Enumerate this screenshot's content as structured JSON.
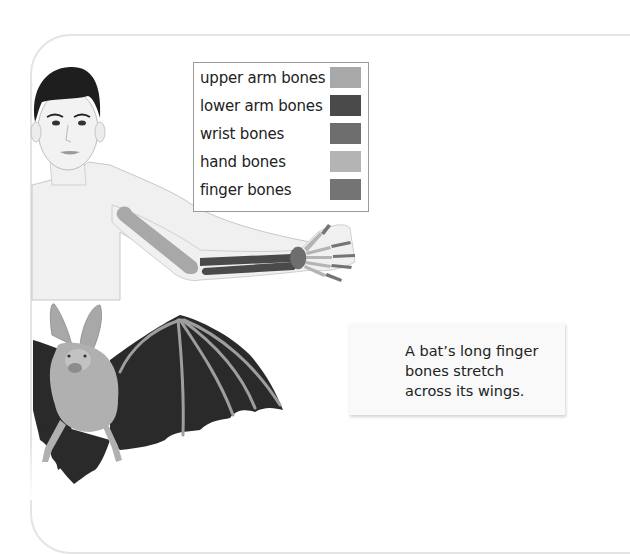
{
  "legend": {
    "items": [
      {
        "label": "upper arm bones",
        "color": "#a8a8a8"
      },
      {
        "label": "lower arm bones",
        "color": "#4a4a4a"
      },
      {
        "label": "wrist bones",
        "color": "#6e6e6e"
      },
      {
        "label": "hand bones",
        "color": "#b4b4b4"
      },
      {
        "label": "finger bones",
        "color": "#747474"
      }
    ]
  },
  "caption": {
    "text": "A bat’s long finger bones stretch across its wings."
  },
  "illustrations": {
    "human": "human-figure-with-arm-bones",
    "bat": "bat-with-wing-bones"
  },
  "colors": {
    "panel_border": "#e4e4e4",
    "skin": "#eeeeee",
    "hair": "#1e1e1e",
    "bat_wing": "#2a2a2a",
    "bat_fur": "#b0b0b0"
  }
}
